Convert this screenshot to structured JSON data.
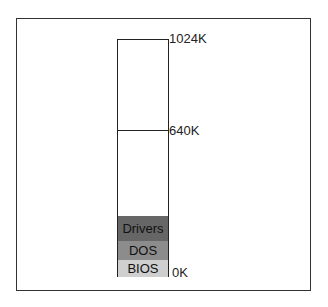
{
  "diagram": {
    "title": "",
    "markers": {
      "top": "1024K",
      "middle": "640K",
      "bottom": "0K"
    },
    "segments": [
      {
        "label": "Drivers",
        "color": "#666666"
      },
      {
        "label": "DOS",
        "color": "#8c8c8c"
      },
      {
        "label": "BIOS",
        "color": "#cfcfcf"
      }
    ]
  }
}
